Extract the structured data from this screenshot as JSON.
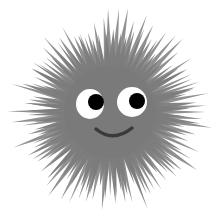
{
  "image": {
    "subject": "cartoon sea urchin with smiling face",
    "width": 217,
    "height": 218
  },
  "colors": {
    "background": "#ffffff",
    "body": "#7a7a7a",
    "spike": "#7c7c7c",
    "eye_white": "#ffffff",
    "pupil": "#000000",
    "mouth": "#3a3a3a"
  },
  "urchin": {
    "center": [
      110,
      112
    ],
    "body_radius": 46,
    "spike_count": 72,
    "spike_min_length": 82,
    "spike_max_length": 106,
    "spike_base_width": 7
  },
  "face": {
    "left_eye": {
      "cx": 90,
      "cy": 104,
      "rx": 14,
      "ry": 15,
      "pupil_cx": 96,
      "pupil_cy": 102,
      "pupil_r": 8
    },
    "right_eye": {
      "cx": 132,
      "cy": 102,
      "rx": 15,
      "ry": 15,
      "pupil_cx": 137,
      "pupil_cy": 101,
      "pupil_r": 8
    },
    "mouth_path": "M96 129 Q113 143 132 128"
  }
}
